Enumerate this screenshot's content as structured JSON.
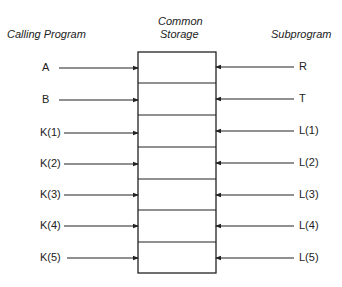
{
  "headers": {
    "calling_program": "Calling Program",
    "common_storage_line1": "Common",
    "common_storage_line2": "Storage",
    "subprogram": "Subprogram"
  },
  "calling_program_vars": [
    "A",
    "B",
    "K(1)",
    "K(2)",
    "K(3)",
    "K(4)",
    "K(5)"
  ],
  "subprogram_vars": [
    "R",
    "T",
    "L(1)",
    "L(2)",
    "L(3)",
    "L(4)",
    "L(5)"
  ],
  "storage_cells": 7,
  "colors": {
    "line": "#222222",
    "text": "#222222",
    "background": "#ffffff"
  }
}
